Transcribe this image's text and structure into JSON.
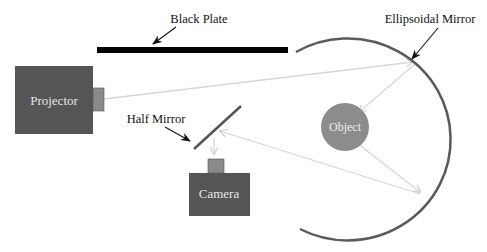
{
  "labels": {
    "black_plate": "Black Plate",
    "ellipsoidal_mirror": "Ellipsoidal Mirror",
    "half_mirror": "Half Mirror",
    "projector": "Projector",
    "camera": "Camera",
    "object": "Object"
  },
  "colors": {
    "device_body": "#555555",
    "device_lens": "#8a8a8a",
    "device_text": "#e6e6e6",
    "object_fill": "#8c8c8c",
    "object_text": "#ececec",
    "mirror_stroke": "#5a5a5a",
    "plate_fill": "#000000",
    "ray_stroke": "#d4d4d4",
    "annotation": "#111111"
  }
}
